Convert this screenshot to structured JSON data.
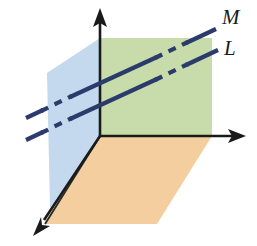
{
  "figure": {
    "background_color": "#ffffff",
    "canvas": {
      "width": 257,
      "height": 246
    },
    "origin": {
      "x": 100,
      "y": 136
    }
  },
  "colors": {
    "plane_blue": "#c4d9ee",
    "plane_green": "#c8dcab",
    "plane_orange": "#f5cea0",
    "line_navy": "#2b3b6b",
    "axis_black": "#1a1a1a",
    "edge_dark": "#2b2b22"
  },
  "planes": [
    {
      "name": "left-plane",
      "fill": "#c4d9ee",
      "points": "100,136 56,36 56,208 100,136",
      "polygon": "47,73 100,38 100,136 50,208"
    },
    {
      "name": "back-plane",
      "fill": "#c8dcab",
      "polygon": "100,38 212,38 212,136 100,136"
    },
    {
      "name": "bottom-plane",
      "fill": "#f5cea0",
      "polygon": "100,136 212,136 157,224 45,224"
    }
  ],
  "axes": [
    {
      "name": "vertical-axis",
      "label": "",
      "from": {
        "x": 100,
        "y": 136
      },
      "to": {
        "x": 100,
        "y": 12
      },
      "arrow": "up"
    },
    {
      "name": "horizontal-axis",
      "label": "",
      "from": {
        "x": 100,
        "y": 136
      },
      "to": {
        "x": 243,
        "y": 136
      },
      "arrow": "right"
    },
    {
      "name": "depth-axis",
      "label": "",
      "from": {
        "x": 100,
        "y": 136
      },
      "to": {
        "x": 36,
        "y": 232
      },
      "arrow": "down-left"
    }
  ],
  "lines": [
    {
      "name": "line-m",
      "label": "M",
      "label_position": {
        "x": 222,
        "y": 24
      },
      "color": "#2b3b6b",
      "segments": [
        {
          "style": "solid",
          "x1": 26,
          "y1": 118,
          "x2": 41,
          "y2": 111
        },
        {
          "style": "dashed",
          "x1": 41,
          "y1": 111,
          "x2": 70,
          "y2": 97
        },
        {
          "style": "solid",
          "x1": 70,
          "y1": 97,
          "x2": 156,
          "y2": 57
        },
        {
          "style": "dashed",
          "x1": 156,
          "y1": 57,
          "x2": 186,
          "y2": 43
        },
        {
          "style": "solid",
          "x1": 186,
          "y1": 43,
          "x2": 216,
          "y2": 29
        }
      ]
    },
    {
      "name": "line-l",
      "label": "L",
      "label_position": {
        "x": 224,
        "y": 55
      },
      "color": "#2b3b6b",
      "segments": [
        {
          "style": "solid",
          "x1": 26,
          "y1": 140,
          "x2": 41,
          "y2": 133
        },
        {
          "style": "dashed",
          "x1": 41,
          "y1": 133,
          "x2": 70,
          "y2": 119
        },
        {
          "style": "solid",
          "x1": 70,
          "y1": 119,
          "x2": 156,
          "y2": 79
        },
        {
          "style": "dashed",
          "x1": 156,
          "y1": 79,
          "x2": 186,
          "y2": 65
        },
        {
          "style": "solid",
          "x1": 186,
          "y1": 65,
          "x2": 218,
          "y2": 50
        }
      ]
    }
  ]
}
